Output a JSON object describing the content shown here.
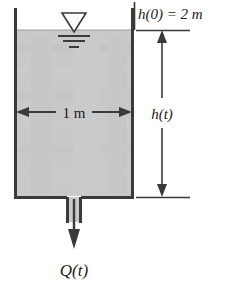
{
  "figure": {
    "name": "draining-tank-diagram"
  },
  "labels": {
    "initial_height": "h(0) = 2 m",
    "height_variable": "h(t)",
    "width_dimension": "1 m",
    "flow_rate": "Q(t)"
  },
  "colors": {
    "water_fill": "#c9c9c9",
    "outline": "#3a3a3a",
    "background": "#ffffff",
    "text": "#1a1a1a"
  },
  "icons": {
    "free_surface": "free-surface-triangle-icon",
    "flow_arrow": "down-arrow-icon",
    "width_arrow": "double-headed-arrow-icon",
    "height_arrow": "vertical-dimension-arrow-icon"
  },
  "geometry": {
    "tank_left": 15,
    "tank_right": 133,
    "water_top": 30,
    "tank_bottom": 197,
    "dimension_line_x": 162,
    "outlet_center_x": 74
  }
}
